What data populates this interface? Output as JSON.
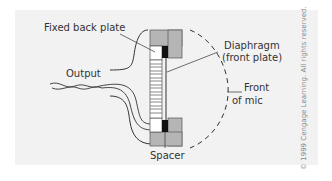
{
  "figure": {
    "labels": {
      "fixed_back_plate": "Fixed back plate",
      "output": "Output",
      "diaphragm_line1": "Diaphragm",
      "diaphragm_line2": "(front plate)",
      "front_line1": "Front",
      "front_line2": "of mic",
      "spacer": "Spacer"
    },
    "copyright": "© 1999 Cengage Learning. All rights reserved.",
    "colors": {
      "background_panel": "#f2f2f2",
      "housing_gray": "#b5b5b5",
      "spacer_black": "#111111",
      "line": "#333333",
      "text": "#333333"
    }
  }
}
